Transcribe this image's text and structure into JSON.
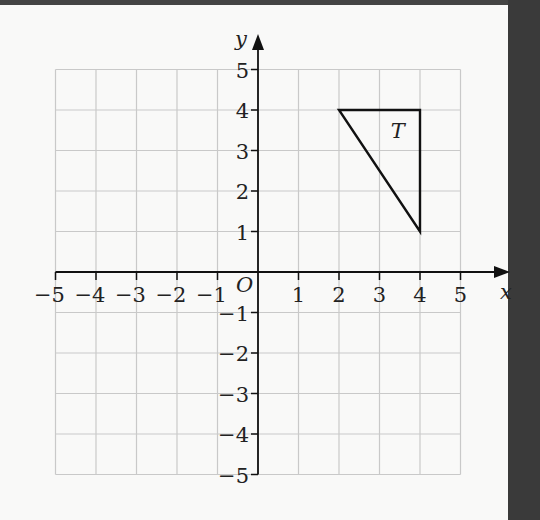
{
  "figure": {
    "x_axis": {
      "label": "x",
      "ticks": [
        {
          "value": -5,
          "label": "−5"
        },
        {
          "value": -4,
          "label": "−4"
        },
        {
          "value": -3,
          "label": "−3"
        },
        {
          "value": -2,
          "label": "−2"
        },
        {
          "value": -1,
          "label": "−1"
        },
        {
          "value": 1,
          "label": "1"
        },
        {
          "value": 2,
          "label": "2"
        },
        {
          "value": 3,
          "label": "3"
        },
        {
          "value": 4,
          "label": "4"
        },
        {
          "value": 5,
          "label": "5"
        }
      ]
    },
    "y_axis": {
      "label": "y",
      "ticks": [
        {
          "value": 5,
          "label": "5"
        },
        {
          "value": 4,
          "label": "4"
        },
        {
          "value": 3,
          "label": "3"
        },
        {
          "value": 2,
          "label": "2"
        },
        {
          "value": 1,
          "label": "1"
        },
        {
          "value": -1,
          "label": "−1"
        },
        {
          "value": -2,
          "label": "−2"
        },
        {
          "value": -3,
          "label": "−3"
        },
        {
          "value": -4,
          "label": "−4"
        },
        {
          "value": -5,
          "label": "−5"
        }
      ]
    },
    "origin_label": "O",
    "shape": {
      "label": "T",
      "vertices": [
        [
          2,
          4
        ],
        [
          4,
          4
        ],
        [
          4,
          1
        ]
      ],
      "label_position": [
        3.5,
        3.5
      ]
    },
    "grid": {
      "xmin": -5,
      "xmax": 5,
      "ymin": -5,
      "ymax": 5,
      "step": 1
    }
  }
}
